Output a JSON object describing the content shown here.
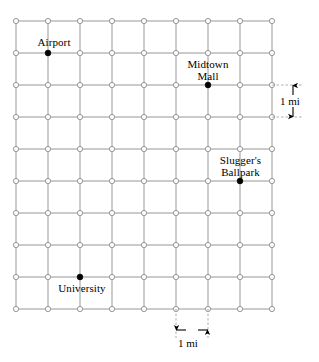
{
  "figure": {
    "kind": "street-grid-map",
    "width": 319,
    "height": 362,
    "background_color": "#ffffff",
    "grid_line_color": "#8c8c8c",
    "node_stroke_color": "#8c8c8c",
    "node_fill_color": "#ffffff",
    "landmark_dot_color": "#000000",
    "dashed_leader_color": "#9a9a9a",
    "arrow_color": "#000000"
  },
  "grid": {
    "columns": 9,
    "rows": 10,
    "x_start": 16,
    "y_start": 21,
    "spacing_px": 32,
    "spacing_label": "1 mi",
    "node_radius": 2.6,
    "landmark_radius": 2.9
  },
  "landmarks": [
    {
      "id": "airport",
      "name": "Airport",
      "lines": [
        "Airport"
      ],
      "col": 1,
      "row": 1,
      "x": 48,
      "y": 53,
      "label_left": 31,
      "label_top": 36,
      "label_align": "center",
      "label_width": 46
    },
    {
      "id": "midtown-mall",
      "name": "Midtown Mall",
      "lines": [
        "Midtown",
        "Mall"
      ],
      "col": 6,
      "row": 2,
      "x": 208,
      "y": 85,
      "label_left": 180,
      "label_top": 58,
      "label_align": "center",
      "label_width": 56
    },
    {
      "id": "sluggers-ballpark",
      "name": "Slugger's Ballpark",
      "lines": [
        "Slugger's",
        "Ballpark"
      ],
      "col": 7,
      "row": 5,
      "x": 240,
      "y": 181,
      "label_left": 212,
      "label_top": 154,
      "label_align": "center",
      "label_width": 57
    },
    {
      "id": "university",
      "name": "University",
      "lines": [
        "University"
      ],
      "col": 2,
      "row": 8,
      "x": 80,
      "y": 277,
      "label_left": 54,
      "label_top": 282,
      "label_align": "center",
      "label_width": 56
    }
  ],
  "scale_bars": [
    {
      "id": "vertical-scale",
      "orientation": "vertical",
      "label": "1 mi",
      "from_value": 85,
      "to_value": 117,
      "axis_px": 293,
      "leader_from_x": 272,
      "leader_to_x": 303,
      "label_left": 280,
      "label_top": 95
    },
    {
      "id": "horizontal-scale",
      "orientation": "horizontal",
      "label": "1 mi",
      "from_value": 176,
      "to_value": 208,
      "axis_px": 330,
      "leader_from_y": 309,
      "leader_to_y": 338,
      "label_left": 178,
      "label_top": 337
    }
  ]
}
